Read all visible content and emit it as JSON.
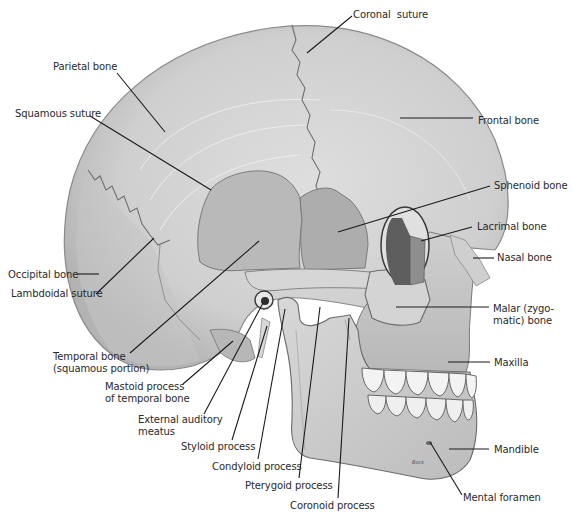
{
  "figure": {
    "signature": "Bock",
    "colors": {
      "background": "#ffffff",
      "bone_light": "#d9d9d9",
      "bone_mid": "#c6c6c6",
      "bone_dark": "#a7a7a7",
      "sphenoid": "#b4b4b4",
      "orbit": "#6f6f6f",
      "teeth": "#f2f2f2",
      "leader_line": "#1a1a1a",
      "label_text": "#2a2a2a"
    }
  },
  "labels": [
    {
      "id": "coronal-suture",
      "text": "Coronal  suture",
      "x": 353,
      "y": 9,
      "line": [
        352,
        16,
        307,
        53
      ]
    },
    {
      "id": "parietal-bone",
      "text": "Parietal bone",
      "x": 53,
      "y": 61,
      "line": [
        117,
        73,
        165,
        132
      ]
    },
    {
      "id": "squamous-suture",
      "text": "Squamous suture",
      "x": 15,
      "y": 108,
      "line": [
        90,
        116,
        211,
        190
      ]
    },
    {
      "id": "frontal-bone",
      "text": "Frontal bone",
      "x": 478,
      "y": 115,
      "line": [
        400,
        118,
        473,
        118
      ]
    },
    {
      "id": "sphenoid-bone",
      "text": "Sphenoid bone",
      "x": 494,
      "y": 180,
      "line": [
        490,
        186,
        338,
        232
      ]
    },
    {
      "id": "lacrimal-bone",
      "text": "Lacrimal bone",
      "x": 477,
      "y": 221,
      "line": [
        472,
        227,
        421,
        241
      ]
    },
    {
      "id": "nasal-bone",
      "text": "Nasal bone",
      "x": 497,
      "y": 252,
      "line": [
        473,
        258,
        494,
        258
      ]
    },
    {
      "id": "occipital-bone",
      "text": "Occipital bone",
      "x": 8,
      "y": 269,
      "line": [
        77,
        274,
        99,
        274
      ]
    },
    {
      "id": "malar-bone",
      "text": "Malar (zygo-\nmatic) bone",
      "x": 493,
      "y": 303,
      "line": [
        396,
        307,
        489,
        307
      ]
    },
    {
      "id": "lambdoidal-suture",
      "text": "Lambdoidal suture",
      "x": 11,
      "y": 288,
      "line": [
        96,
        294,
        154,
        238
      ]
    },
    {
      "id": "temporal-bone",
      "text": "Temporal bone\n(squamous portion)",
      "x": 53,
      "y": 351,
      "line": [
        130,
        353,
        259,
        241
      ]
    },
    {
      "id": "maxilla",
      "text": "Maxilla",
      "x": 494,
      "y": 357,
      "line": [
        448,
        362,
        490,
        362
      ]
    },
    {
      "id": "mastoid-process",
      "text": "Mastoid process\nof temporal bone",
      "x": 105,
      "y": 381,
      "line": [
        183,
        384,
        233,
        341
      ]
    },
    {
      "id": "external-auditory-meatus",
      "text": "External auditory\nmeatus",
      "x": 138,
      "y": 414,
      "line": [
        204,
        414,
        263,
        303
      ]
    },
    {
      "id": "styloid-process",
      "text": "Styloid process",
      "x": 181,
      "y": 441,
      "line": [
        232,
        440,
        267,
        326
      ]
    },
    {
      "id": "mandible",
      "text": "Mandible",
      "x": 494,
      "y": 444,
      "line": [
        449,
        449,
        489,
        449
      ]
    },
    {
      "id": "condyloid-process",
      "text": "Condyloid process",
      "x": 212,
      "y": 461,
      "line": [
        258,
        459,
        285,
        309
      ]
    },
    {
      "id": "pterygoid-process",
      "text": "Pterygoid process",
      "x": 245,
      "y": 480,
      "line": [
        299,
        478,
        320,
        307
      ]
    },
    {
      "id": "mental-foramen",
      "text": "Mental foramen",
      "x": 463,
      "y": 492,
      "line": [
        462,
        495,
        430,
        442
      ]
    },
    {
      "id": "coronoid-process",
      "text": "Coronoid process",
      "x": 290,
      "y": 500,
      "line": [
        338,
        498,
        349,
        318
      ]
    }
  ]
}
